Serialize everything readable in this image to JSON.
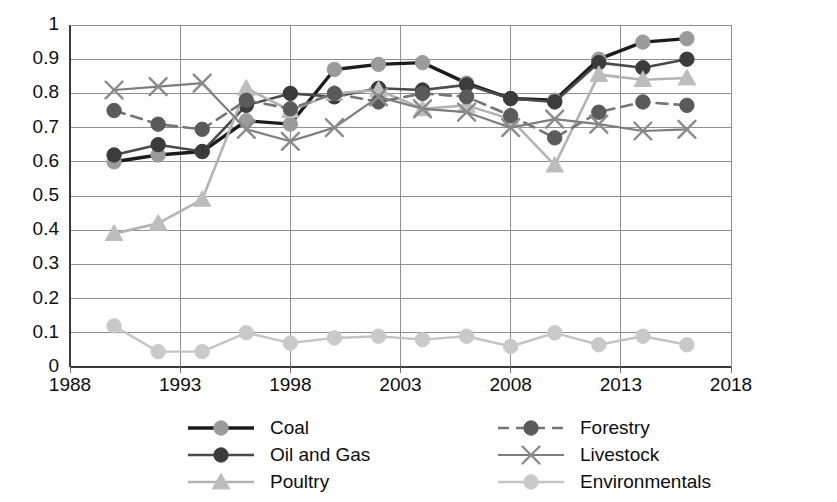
{
  "chart_data": {
    "type": "line",
    "title": "",
    "subtitle": "",
    "xlabel": "",
    "ylabel": "",
    "xlim": [
      1988,
      2018
    ],
    "ylim": [
      0,
      1
    ],
    "grid": true,
    "legend_position": "bottom",
    "x_ticks": [
      "1988",
      "1993",
      "1998",
      "2003",
      "2008",
      "2013",
      "2018"
    ],
    "x_tick_values": [
      1988,
      1993,
      1998,
      2003,
      2008,
      2013,
      2018
    ],
    "y_ticks": [
      "0",
      "0.1",
      "0.2",
      "0.3",
      "0.4",
      "0.5",
      "0.6",
      "0.7",
      "0.8",
      "0.9",
      "1"
    ],
    "y_tick_values": [
      0,
      0.1,
      0.2,
      0.3,
      0.4,
      0.5,
      0.6,
      0.7,
      0.8,
      0.9,
      1
    ],
    "x": [
      1990,
      1992,
      1994,
      1996,
      1998,
      2000,
      2002,
      2004,
      2006,
      2008,
      2010,
      2012,
      2014,
      2016
    ],
    "series": [
      {
        "name": "Coal",
        "color": "#1c1c1c",
        "marker": "circle",
        "marker_color": "#9b9b9b",
        "dash": "solid",
        "width": 3.4,
        "values": [
          0.6,
          0.62,
          0.63,
          0.72,
          0.71,
          0.87,
          0.885,
          0.89,
          0.83,
          0.785,
          0.78,
          0.9,
          0.95,
          0.96
        ]
      },
      {
        "name": "Oil and Gas",
        "color": "#4a4a4a",
        "marker": "circle",
        "marker_color": "#3b3b3b",
        "dash": "solid",
        "width": 2.6,
        "values": [
          0.62,
          0.65,
          0.63,
          0.765,
          0.8,
          0.79,
          0.815,
          0.81,
          0.825,
          0.785,
          0.775,
          0.89,
          0.875,
          0.9
        ]
      },
      {
        "name": "Poultry",
        "color": "#b3b3b3",
        "marker": "triangle",
        "marker_color": "#bdbdbd",
        "dash": "solid",
        "width": 2.6,
        "values": [
          0.39,
          0.42,
          0.49,
          0.815,
          0.75,
          0.8,
          0.81,
          0.755,
          0.765,
          0.725,
          0.59,
          0.855,
          0.84,
          0.845
        ]
      },
      {
        "name": "Forestry",
        "color": "#757575",
        "marker": "circle",
        "marker_color": "#5a5a5a",
        "dash": "dashed",
        "width": 2.6,
        "values": [
          0.75,
          0.71,
          0.695,
          0.78,
          0.755,
          0.8,
          0.775,
          0.8,
          0.79,
          0.735,
          0.67,
          0.745,
          0.775,
          0.765
        ]
      },
      {
        "name": "Livestock",
        "color": "#7d7d7d",
        "marker": "cross",
        "marker_color": "#8a8a8a",
        "dash": "solid",
        "width": 2.2,
        "values": [
          0.81,
          0.82,
          0.83,
          0.695,
          0.66,
          0.7,
          0.79,
          0.755,
          0.745,
          0.7,
          0.725,
          0.71,
          0.69,
          0.695
        ]
      },
      {
        "name": "Environmentals",
        "color": "#c4c4c4",
        "marker": "circle",
        "marker_color": "#c9c9c9",
        "dash": "solid",
        "width": 2.4,
        "values": [
          0.12,
          0.045,
          0.045,
          0.1,
          0.07,
          0.085,
          0.09,
          0.08,
          0.09,
          0.06,
          0.1,
          0.065,
          0.09,
          0.065
        ]
      }
    ]
  },
  "legend": {
    "items": [
      {
        "label": "Coal"
      },
      {
        "label": "Oil and Gas"
      },
      {
        "label": "Poultry"
      },
      {
        "label": "Forestry"
      },
      {
        "label": "Livestock"
      },
      {
        "label": "Environmentals"
      }
    ]
  }
}
